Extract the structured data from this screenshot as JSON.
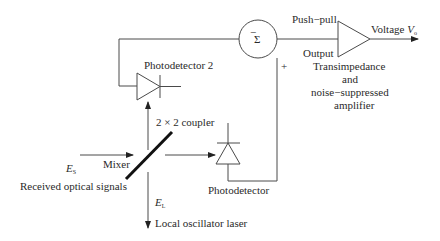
{
  "diagram": {
    "labels": {
      "photodetector2": "Photodetector 2",
      "photodetector": "Photodetector",
      "coupler": "2 × 2 coupler",
      "mixer": "Mixer",
      "received_signal_symbol": "E",
      "received_signal_sub": "S",
      "received_signal": "Received optical signals",
      "local_osc_symbol": "E",
      "local_osc_sub": "L",
      "local_osc": "Local oscillator laser",
      "summer_symbol": "Σ",
      "minus": "−",
      "plus": "+",
      "push_pull": "Push−pull",
      "output": "Output",
      "amp_line1": "Transimpedance",
      "amp_line2": "and",
      "amp_line3": "noise−suppressed",
      "amp_line4": "amplifier",
      "voltage": "Voltage ",
      "voltage_symbol": "V",
      "voltage_sub": "o"
    },
    "colors": {
      "line": "#4a4a4a",
      "text": "#2a2a2a",
      "coupler": "#111111",
      "background": "#ffffff"
    }
  }
}
